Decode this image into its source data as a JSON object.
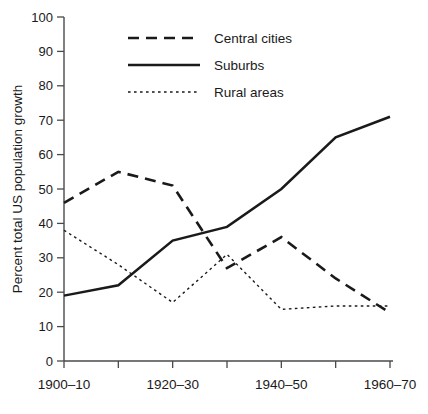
{
  "chart_data": {
    "type": "line",
    "title": "",
    "xlabel": "",
    "ylabel": "Percent total US population growth",
    "ylim": [
      0,
      100
    ],
    "ytick_step": 10,
    "grid": false,
    "legend_position": "top-center",
    "categories": [
      "1900–10",
      "1910–20",
      "1920–30",
      "1930–40",
      "1940–50",
      "1950–60",
      "1960–70"
    ],
    "visible_xtick_labels": [
      "1900–10",
      "1920–30",
      "1940–50",
      "1960–70"
    ],
    "yticks": [
      "0",
      "10",
      "20",
      "30",
      "40",
      "50",
      "60",
      "70",
      "80",
      "90",
      "100"
    ],
    "series": [
      {
        "name": "Central cities",
        "style": "dashed",
        "color": "#1a1a1a",
        "values": [
          46,
          55,
          51,
          27,
          36,
          24,
          14
        ]
      },
      {
        "name": "Suburbs",
        "style": "solid",
        "color": "#1a1a1a",
        "values": [
          19,
          22,
          35,
          39,
          50,
          65,
          71
        ]
      },
      {
        "name": "Rural areas",
        "style": "dotted",
        "color": "#1a1a1a",
        "values": [
          38,
          28,
          17,
          31,
          15,
          16,
          16
        ]
      }
    ]
  },
  "legend": {
    "items": [
      {
        "label": "Central cities",
        "style": "dashed"
      },
      {
        "label": "Suburbs",
        "style": "solid"
      },
      {
        "label": "Rural areas",
        "style": "dotted"
      }
    ]
  },
  "colors": {
    "ink": "#1a1a1a",
    "axis": "#4a4a4a",
    "background": "#ffffff"
  }
}
